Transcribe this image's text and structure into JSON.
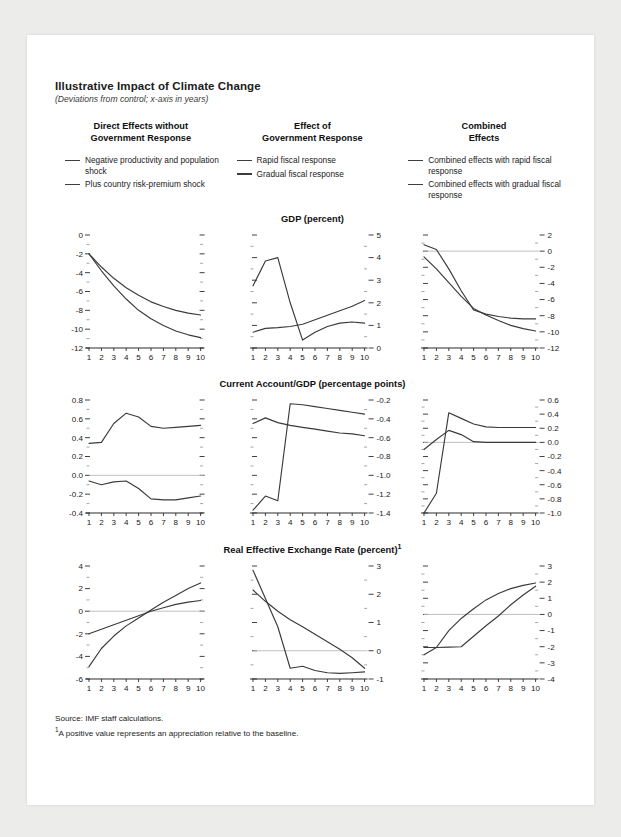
{
  "figure": {
    "title": "Illustrative Impact of Climate Change",
    "subtitle": "(Deviations from control; x-axis in years)",
    "source": "Source: IMF staff calculations.",
    "footnote_marker": "1",
    "footnote": "A positive value represents an appreciation relative to the baseline."
  },
  "columns": [
    {
      "heading_line1": "Direct Effects without",
      "heading_line2": "Government Response",
      "legend": [
        "Negative productivity and population shock",
        "Plus country risk-premium shock"
      ]
    },
    {
      "heading_line1": "Effect of",
      "heading_line2": "Government Response",
      "legend": [
        "Rapid fiscal response",
        "Gradual fiscal response"
      ]
    },
    {
      "heading_line1": "Combined",
      "heading_line2": "Effects",
      "legend": [
        "Combined effects with rapid fiscal response",
        "Combined effects with gradual fiscal response"
      ]
    }
  ],
  "row_titles": [
    "GDP (percent)",
    "Current Account/GDP (percentage points)",
    "Real Effective Exchange Rate (percent)"
  ],
  "chart_data": [
    {
      "id": "gdp-direct",
      "type": "line",
      "title": "GDP (percent)",
      "xlabel": "",
      "ylabel": "",
      "x": [
        1,
        2,
        3,
        4,
        5,
        6,
        7,
        8,
        9,
        10
      ],
      "xticklabels": [
        "1",
        "2",
        "3",
        "4",
        "5",
        "6",
        "7",
        "8",
        "9",
        "10"
      ],
      "ylim": [
        -12,
        0
      ],
      "yticks": [
        0,
        -2,
        -4,
        -6,
        -8,
        -10,
        -12
      ],
      "yticklabels": [
        "0",
        "-2",
        "-4",
        "-6",
        "-8",
        "-10",
        "-12"
      ],
      "yaxis_side": "left",
      "grid": false,
      "zero_line": false,
      "legend_position": "column-header",
      "series": [
        {
          "name": "Negative productivity and population shock",
          "values": [
            -2.0,
            -3.4,
            -4.6,
            -5.6,
            -6.4,
            -7.1,
            -7.6,
            -8.0,
            -8.3,
            -8.5
          ]
        },
        {
          "name": "Plus country risk-premium shock",
          "values": [
            -2.0,
            -3.8,
            -5.4,
            -6.8,
            -8.0,
            -8.9,
            -9.6,
            -10.2,
            -10.6,
            -10.9
          ]
        }
      ]
    },
    {
      "id": "gdp-government",
      "type": "line",
      "title": "GDP (percent)",
      "xlabel": "",
      "ylabel": "",
      "x": [
        1,
        2,
        3,
        4,
        5,
        6,
        7,
        8,
        9,
        10
      ],
      "xticklabels": [
        "1",
        "2",
        "3",
        "4",
        "5",
        "6",
        "7",
        "8",
        "9",
        "10"
      ],
      "ylim": [
        0,
        5
      ],
      "yticks": [
        5,
        4,
        3,
        2,
        1,
        0
      ],
      "yticklabels": [
        "5",
        "4",
        "3",
        "2",
        "1",
        "0"
      ],
      "yaxis_side": "right",
      "grid": false,
      "zero_line": false,
      "legend_position": "column-header",
      "series": [
        {
          "name": "Rapid fiscal response",
          "values": [
            2.75,
            3.85,
            4.0,
            2.0,
            0.35,
            0.7,
            0.95,
            1.1,
            1.15,
            1.1
          ]
        },
        {
          "name": "Gradual fiscal response",
          "values": [
            0.7,
            0.87,
            0.9,
            0.95,
            1.05,
            1.25,
            1.45,
            1.65,
            1.85,
            2.1
          ]
        }
      ]
    },
    {
      "id": "gdp-combined",
      "type": "line",
      "title": "GDP (percent)",
      "xlabel": "",
      "ylabel": "",
      "x": [
        1,
        2,
        3,
        4,
        5,
        6,
        7,
        8,
        9,
        10
      ],
      "xticklabels": [
        "1",
        "2",
        "3",
        "4",
        "5",
        "6",
        "7",
        "8",
        "9",
        "10"
      ],
      "ylim": [
        -12,
        2
      ],
      "yticks": [
        2,
        0,
        -2,
        -4,
        -6,
        -8,
        -10,
        -12
      ],
      "yticklabels": [
        "2",
        "0",
        "-2",
        "-4",
        "-6",
        "-8",
        "-10",
        "-12"
      ],
      "yaxis_side": "right",
      "grid": false,
      "zero_line": true,
      "legend_position": "column-header",
      "series": [
        {
          "name": "Combined effects with rapid fiscal response",
          "values": [
            0.8,
            0.2,
            -2.2,
            -4.9,
            -7.3,
            -7.8,
            -8.1,
            -8.3,
            -8.4,
            -8.4
          ]
        },
        {
          "name": "Combined effects with gradual fiscal response",
          "values": [
            -0.7,
            -2.2,
            -3.9,
            -5.6,
            -7.1,
            -7.9,
            -8.6,
            -9.2,
            -9.6,
            -9.9
          ]
        }
      ]
    },
    {
      "id": "ca-direct",
      "type": "line",
      "title": "Current Account/GDP (percentage points)",
      "xlabel": "",
      "ylabel": "",
      "x": [
        1,
        2,
        3,
        4,
        5,
        6,
        7,
        8,
        9,
        10
      ],
      "xticklabels": [
        "1",
        "2",
        "3",
        "4",
        "5",
        "6",
        "7",
        "8",
        "9",
        "10"
      ],
      "ylim": [
        -0.4,
        0.8
      ],
      "yticks": [
        0.8,
        0.6,
        0.4,
        0.2,
        0.0,
        -0.2,
        -0.4
      ],
      "yticklabels": [
        "0.8",
        "0.6",
        "0.4",
        "0.2",
        "0.0",
        "-0.2",
        "-0.4"
      ],
      "yaxis_side": "left",
      "grid": false,
      "zero_line": true,
      "legend_position": "column-header",
      "series": [
        {
          "name": "Negative productivity and population shock",
          "values": [
            0.34,
            0.35,
            0.55,
            0.66,
            0.62,
            0.52,
            0.5,
            0.51,
            0.52,
            0.53
          ]
        },
        {
          "name": "Plus country risk-premium shock",
          "values": [
            -0.06,
            -0.1,
            -0.07,
            -0.06,
            -0.14,
            -0.25,
            -0.26,
            -0.26,
            -0.24,
            -0.22
          ]
        }
      ]
    },
    {
      "id": "ca-government",
      "type": "line",
      "title": "Current Account/GDP (percentage points)",
      "xlabel": "",
      "ylabel": "",
      "x": [
        1,
        2,
        3,
        4,
        5,
        6,
        7,
        8,
        9,
        10
      ],
      "xticklabels": [
        "1",
        "2",
        "3",
        "4",
        "5",
        "6",
        "7",
        "8",
        "9",
        "10"
      ],
      "ylim": [
        -1.4,
        -0.2
      ],
      "yticks": [
        -0.2,
        -0.4,
        -0.6,
        -0.8,
        -1.0,
        -1.2,
        -1.4
      ],
      "yticklabels": [
        "-0.2",
        "-0.4",
        "-0.6",
        "-0.8",
        "-1.0",
        "-1.2",
        "-1.4"
      ],
      "yaxis_side": "right",
      "grid": false,
      "zero_line": false,
      "legend_position": "column-header",
      "series": [
        {
          "name": "Rapid fiscal response",
          "values": [
            -1.37,
            -1.22,
            -1.27,
            -0.24,
            -0.25,
            -0.27,
            -0.29,
            -0.31,
            -0.33,
            -0.35
          ]
        },
        {
          "name": "Gradual fiscal response",
          "values": [
            -0.45,
            -0.39,
            -0.44,
            -0.47,
            -0.49,
            -0.51,
            -0.53,
            -0.55,
            -0.56,
            -0.58
          ]
        }
      ]
    },
    {
      "id": "ca-combined",
      "type": "line",
      "title": "Current Account/GDP (percentage points)",
      "xlabel": "",
      "ylabel": "",
      "x": [
        1,
        2,
        3,
        4,
        5,
        6,
        7,
        8,
        9,
        10
      ],
      "xticklabels": [
        "1",
        "2",
        "3",
        "4",
        "5",
        "6",
        "7",
        "8",
        "9",
        "10"
      ],
      "ylim": [
        -1.0,
        0.6
      ],
      "yticks": [
        0.6,
        0.4,
        0.2,
        0.0,
        -0.2,
        -0.4,
        -0.6,
        -0.8,
        -1.0
      ],
      "yticklabels": [
        "0.6",
        "0.4",
        "0.2",
        "0.0",
        "-0.2",
        "-0.4",
        "-0.6",
        "-0.8",
        "-1.0"
      ],
      "yaxis_side": "right",
      "grid": false,
      "zero_line": true,
      "legend_position": "column-header",
      "series": [
        {
          "name": "Combined effects with rapid fiscal response",
          "values": [
            -1.0,
            -0.72,
            0.42,
            0.34,
            0.26,
            0.22,
            0.21,
            0.21,
            0.21,
            0.21
          ]
        },
        {
          "name": "Combined effects with gradual fiscal response",
          "values": [
            -0.1,
            0.04,
            0.17,
            0.11,
            0.01,
            0.0,
            0.0,
            0.0,
            0.0,
            0.0
          ]
        }
      ]
    },
    {
      "id": "reer-direct",
      "type": "line",
      "title": "Real Effective Exchange Rate (percent)",
      "xlabel": "",
      "ylabel": "",
      "x": [
        1,
        2,
        3,
        4,
        5,
        6,
        7,
        8,
        9,
        10
      ],
      "xticklabels": [
        "1",
        "2",
        "3",
        "4",
        "5",
        "6",
        "7",
        "8",
        "9",
        "10"
      ],
      "ylim": [
        -6,
        4
      ],
      "yticks": [
        4,
        2,
        0,
        -2,
        -4,
        -6
      ],
      "yticklabels": [
        "4",
        "2",
        "0",
        "-2",
        "-4",
        "-6"
      ],
      "yaxis_side": "left",
      "grid": false,
      "zero_line": true,
      "legend_position": "column-header",
      "series": [
        {
          "name": "Negative productivity and population shock",
          "values": [
            -4.9,
            -3.3,
            -2.2,
            -1.3,
            -0.6,
            0.1,
            0.8,
            1.4,
            2.0,
            2.5
          ]
        },
        {
          "name": "Plus country risk-premium shock",
          "values": [
            -2.0,
            -1.6,
            -1.2,
            -0.8,
            -0.4,
            0.0,
            0.3,
            0.6,
            0.8,
            0.95
          ]
        }
      ]
    },
    {
      "id": "reer-government",
      "type": "line",
      "title": "Real Effective Exchange Rate (percent)",
      "xlabel": "",
      "ylabel": "",
      "x": [
        1,
        2,
        3,
        4,
        5,
        6,
        7,
        8,
        9,
        10
      ],
      "xticklabels": [
        "1",
        "2",
        "3",
        "4",
        "5",
        "6",
        "7",
        "8",
        "9",
        "10"
      ],
      "ylim": [
        -1,
        3
      ],
      "yticks": [
        3,
        2,
        1,
        0,
        -1
      ],
      "yticklabels": [
        "3",
        "2",
        "1",
        "0",
        "-1"
      ],
      "yaxis_side": "right",
      "grid": false,
      "zero_line": true,
      "legend_position": "column-header",
      "series": [
        {
          "name": "Rapid fiscal response",
          "values": [
            2.85,
            1.85,
            0.85,
            -0.62,
            -0.55,
            -0.7,
            -0.78,
            -0.8,
            -0.78,
            -0.75
          ]
        },
        {
          "name": "Gradual fiscal response",
          "values": [
            2.15,
            1.75,
            1.4,
            1.1,
            0.85,
            0.58,
            0.32,
            0.05,
            -0.25,
            -0.62
          ]
        }
      ]
    },
    {
      "id": "reer-combined",
      "type": "line",
      "title": "Real Effective Exchange Rate (percent)",
      "xlabel": "",
      "ylabel": "",
      "x": [
        1,
        2,
        3,
        4,
        5,
        6,
        7,
        8,
        9,
        10
      ],
      "xticklabels": [
        "1",
        "2",
        "3",
        "4",
        "5",
        "6",
        "7",
        "8",
        "9",
        "10"
      ],
      "ylim": [
        -4,
        3
      ],
      "yticks": [
        3,
        2,
        1,
        0,
        -1,
        -2,
        -3,
        -4
      ],
      "yticklabels": [
        "3",
        "2",
        "1",
        "0",
        "-1",
        "-2",
        "-3",
        "-4"
      ],
      "yaxis_side": "right",
      "grid": false,
      "zero_line": true,
      "legend_position": "column-header",
      "series": [
        {
          "name": "Combined effects with rapid fiscal response",
          "values": [
            -2.5,
            -2.05,
            -1.0,
            -0.25,
            0.35,
            0.9,
            1.3,
            1.6,
            1.8,
            1.95
          ]
        },
        {
          "name": "Combined effects with gradual fiscal response",
          "values": [
            -2.05,
            -2.05,
            -2.03,
            -2.0,
            -1.35,
            -0.7,
            -0.1,
            0.6,
            1.2,
            1.75
          ]
        }
      ]
    }
  ]
}
